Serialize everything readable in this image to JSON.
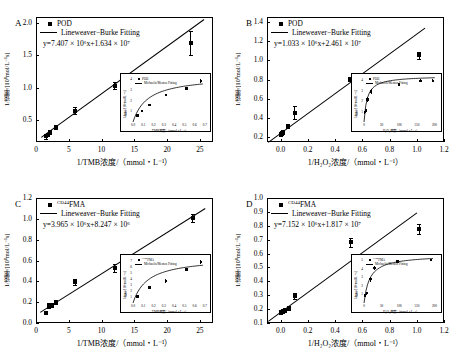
{
  "figure": {
    "panels": [
      {
        "letter": "A",
        "legend_marker_label": "POD",
        "legend_line_label": "Lineweaver−Burke Fitting",
        "equation": "y=7.407 × 10⁶x+1.634 × 10⁷",
        "equation_slope": 7407000.0,
        "equation_intercept": 16340000.0,
        "xlabel": "1/TMB浓度/（mmol・L⁻¹）",
        "ylabel": "1/速率/[10⁸mol/L⁻¹s]",
        "xticks": [
          "0",
          "5",
          "10",
          "15",
          "20",
          "25"
        ],
        "yticks": [
          "0.5",
          "1.0",
          "1.5",
          "2.0"
        ],
        "inset": {
          "legend_marker_label": "POD",
          "legend_line_label": "Michaelis/Menten Fitting",
          "xlabel": "TMB浓度/（mmol・L⁻¹）",
          "ylabel": "1/速率/[10⁸mol/L⁻¹s]",
          "xticks": [
            "0.0",
            "0.1",
            "0.2",
            "0.3",
            "0.4",
            "0.5",
            "0.6",
            "0.7"
          ],
          "yticks": [
            "1",
            "2",
            "3",
            "4"
          ]
        }
      },
      {
        "letter": "B",
        "legend_marker_label": "POD",
        "legend_line_label": "Lineweaver−Burke Fitting",
        "equation": "y=1.033 × 10⁶x+2.461 × 10⁷",
        "equation_slope": 1033000.0,
        "equation_intercept": 24610000.0,
        "xlabel": "1/H₂O₂浓度/（mmol・L⁻¹）",
        "ylabel": "1/速率/[10⁸mol/L⁻¹s]",
        "xticks": [
          "0.0",
          "0.2",
          "0.4",
          "0.6",
          "0.8",
          "1.0",
          "1.2"
        ],
        "yticks": [
          "0.2",
          "0.4",
          "0.6",
          "0.8",
          "1.0",
          "1.2",
          "1.4"
        ],
        "inset": {
          "legend_marker_label": "POD",
          "legend_line_label": "Michaelis/Menten Fitting",
          "xlabel": "H₂O₂浓度/（mmol・L⁻¹）",
          "ylabel": "1/速率/[10⁸mol/L⁻¹s]",
          "xticks": [
            "0",
            "50",
            "100",
            "150",
            "200"
          ],
          "yticks": [
            "1",
            "2",
            "3",
            "4"
          ]
        }
      },
      {
        "letter": "C",
        "legend_marker_label": "CD44FMA",
        "legend_marker_sup": "CD44",
        "legend_marker_base": "FMA",
        "legend_line_label": "Lineweaver−Burke Fitting",
        "equation": "y=3.965 × 10⁶x+8.247 × 10⁶",
        "equation_slope": 3965000.0,
        "equation_intercept": 8247000.0,
        "xlabel": "1/TMB浓度/（mmol・L⁻¹）",
        "ylabel": "1/速率/[10⁸mol/L⁻¹s]",
        "xticks": [
          "0",
          "5",
          "10",
          "15",
          "20",
          "25"
        ],
        "yticks": [
          "0.0",
          "0.2",
          "0.4",
          "0.6",
          "0.8",
          "1.0",
          "1.2"
        ],
        "inset": {
          "legend_marker_label": "CD44FMA",
          "legend_marker_sup": "CD44",
          "legend_marker_base": "FMA",
          "legend_line_label": "Michaelis/Menten Fitting",
          "xlabel": "TMB浓度/（mmol・L⁻¹）",
          "ylabel": "1/速率/[10⁸mol/L⁻¹s]",
          "xticks": [
            "0.0",
            "0.1",
            "0.2",
            "0.3",
            "0.4",
            "0.5",
            "0.6",
            "0.7"
          ],
          "yticks": [
            "1",
            "2",
            "3",
            "4",
            "5",
            "6",
            "7"
          ]
        }
      },
      {
        "letter": "D",
        "legend_marker_label": "CD44FMA",
        "legend_marker_sup": "CD44",
        "legend_marker_base": "FMA",
        "legend_line_label": "Lineweaver−Burke Fitting",
        "equation": "y=7.152 × 10⁶x+1.817 × 10⁷",
        "equation_slope": 7152000.0,
        "equation_intercept": 18170000.0,
        "xlabel": "1/H₂O₂浓度/（mmol・L⁻¹）",
        "ylabel": "1/速率/[10⁸mol/L⁻¹s]",
        "xticks": [
          "0.0",
          "0.2",
          "0.4",
          "0.6",
          "0.8",
          "1.0",
          "1.2"
        ],
        "yticks": [
          "0.1",
          "0.2",
          "0.3",
          "0.4",
          "0.5",
          "0.6",
          "0.7",
          "0.8",
          "0.9",
          "1.0"
        ],
        "inset": {
          "legend_marker_label": "CD44FMA",
          "legend_marker_sup": "CD44",
          "legend_marker_base": "FMA",
          "legend_line_label": "Michaelis/Menten Fitting",
          "xlabel": "H₂O₂浓度/（mmol・L⁻¹）",
          "ylabel": "1/速率/[10⁸mol/L⁻¹s]",
          "xticks": [
            "0",
            "50",
            "100",
            "150",
            "200"
          ],
          "yticks": [
            "1",
            "2",
            "3",
            "4",
            "5"
          ]
        }
      }
    ]
  },
  "chart_data": [
    {
      "id": "A",
      "type": "scatter",
      "title": "A",
      "xlabel": "1/TMB浓度/（mmol・L⁻¹）",
      "ylabel": "1/速率/[10⁸mol/L⁻¹s]",
      "xlim": [
        0,
        27
      ],
      "ylim": [
        0.15,
        2.1
      ],
      "grid": false,
      "legend_position": "top-left",
      "annotations": [
        "y=7.407 × 10⁶x+1.634 × 10⁷"
      ],
      "series": [
        {
          "name": "POD",
          "marker": "filled-square",
          "x": [
            1.6,
            1.9,
            2.2,
            3.1,
            6.0,
            12.0,
            23.6
          ],
          "y": [
            0.24,
            0.26,
            0.3,
            0.38,
            0.64,
            1.03,
            1.69
          ],
          "yerr": [
            0.04,
            0.02,
            0.02,
            0.02,
            0.06,
            0.05,
            0.19
          ]
        },
        {
          "name": "Lineweaver−Burke Fitting",
          "type": "line",
          "slope": 0.07407,
          "intercept": 0.1634,
          "x_range": [
            0.8,
            25.6
          ]
        }
      ],
      "inset": {
        "type": "scatter",
        "xlabel": "TMB浓度/（mmol・L⁻¹）",
        "ylabel": "1/速率/[10⁸mol/L⁻¹s]",
        "xlim": [
          0.0,
          0.72
        ],
        "ylim": [
          0,
          4.3
        ],
        "series": [
          {
            "name": "POD",
            "marker": "filled-square",
            "x": [
              0.045,
              0.085,
              0.16,
              0.32,
              0.52,
              0.66
            ],
            "y": [
              0.62,
              1.05,
              1.6,
              2.52,
              3.15,
              3.85
            ],
            "yerr": [
              0.08,
              0.08,
              0.1,
              0.12,
              0.15,
              0.2
            ]
          },
          {
            "name": "Michaelis/Menten Fitting",
            "type": "curve"
          }
        ]
      }
    },
    {
      "id": "B",
      "type": "scatter",
      "title": "B",
      "xlabel": "1/H₂O₂浓度/（mmol・L⁻¹）",
      "ylabel": "1/速率/[10⁸mol/L⁻¹s]",
      "xlim": [
        -0.1,
        1.2
      ],
      "ylim": [
        0.15,
        1.45
      ],
      "grid": false,
      "legend_position": "top-left",
      "annotations": [
        "y=1.033 × 10⁶x+2.461 × 10⁷"
      ],
      "series": [
        {
          "name": "POD",
          "marker": "filled-square",
          "x": [
            0.005,
            0.012,
            0.02,
            0.055,
            0.105,
            0.51,
            1.02
          ],
          "y": [
            0.235,
            0.245,
            0.25,
            0.32,
            0.455,
            0.805,
            1.05
          ],
          "yerr": [
            0.02,
            0.02,
            0.02,
            0.02,
            0.065,
            0.02,
            0.035
          ]
        },
        {
          "name": "Lineweaver−Burke Fitting",
          "type": "line",
          "slope": 1.033,
          "intercept": 0.2461,
          "x_range": [
            -0.09,
            1.06
          ]
        }
      ],
      "inset": {
        "type": "scatter",
        "xlabel": "H₂O₂浓度/（mmol・L⁻¹）",
        "ylabel": "1/速率/[10⁸mol/L⁻¹s]",
        "xlim": [
          0,
          210
        ],
        "ylim": [
          0,
          4.4
        ],
        "series": [
          {
            "name": "POD",
            "marker": "filled-square",
            "x": [
              2,
              5,
              10,
              20,
              100,
              160,
              195
            ],
            "y": [
              0.95,
              1.1,
              2.15,
              2.9,
              3.6,
              3.95,
              3.95
            ],
            "yerr": [
              0.15,
              0.15,
              0.25,
              0.25,
              0.12,
              0.15,
              0.12
            ]
          },
          {
            "name": "Michaelis/Menten Fitting",
            "type": "curve"
          }
        ]
      }
    },
    {
      "id": "C",
      "type": "scatter",
      "title": "C",
      "xlabel": "1/TMB浓度/（mmol・L⁻¹）",
      "ylabel": "1/速率/[10⁸mol/L⁻¹s]",
      "xlim": [
        0,
        27
      ],
      "ylim": [
        0.0,
        1.2
      ],
      "grid": false,
      "legend_position": "top-left",
      "annotations": [
        "y=3.965 × 10⁶x+8.247 × 10⁶"
      ],
      "series": [
        {
          "name": "CD44FMA",
          "marker": "filled-square",
          "x": [
            1.6,
            2.0,
            2.4,
            3.1,
            6.0,
            12.0,
            23.9
          ],
          "y": [
            0.1,
            0.165,
            0.175,
            0.2,
            0.395,
            0.525,
            1.01
          ],
          "yerr": [
            0.015,
            0.025,
            0.02,
            0.02,
            0.03,
            0.04,
            0.04
          ]
        },
        {
          "name": "Lineweaver−Burke Fitting",
          "type": "line",
          "slope": 0.03965,
          "intercept": 0.08247,
          "x_range": [
            0.6,
            25.8
          ]
        }
      ],
      "inset": {
        "type": "scatter",
        "xlabel": "TMB浓度/（mmol・L⁻¹）",
        "ylabel": "1/速率/[10⁸mol/L⁻¹s]",
        "xlim": [
          0.0,
          0.72
        ],
        "ylim": [
          0,
          7.6
        ],
        "series": [
          {
            "name": "CD44FMA",
            "marker": "filled-square",
            "x": [
              0.045,
              0.16,
              0.32,
              0.52,
              0.66
            ],
            "y": [
              1.05,
              2.55,
              3.65,
              5.55,
              6.75
            ],
            "yerr": [
              0.15,
              0.3,
              0.35,
              0.3,
              0.3
            ]
          },
          {
            "name": "Michaelis/Menten Fitting",
            "type": "curve"
          }
        ]
      }
    },
    {
      "id": "D",
      "type": "scatter",
      "title": "D",
      "xlabel": "1/H₂O₂浓度/（mmol・L⁻¹）",
      "ylabel": "1/速率/[10⁸mol/L⁻¹s]",
      "xlim": [
        -0.1,
        1.2
      ],
      "ylim": [
        0.1,
        1.0
      ],
      "grid": false,
      "legend_position": "top-left",
      "annotations": [
        "y=7.152 × 10⁶x+1.817 × 10⁷"
      ],
      "series": [
        {
          "name": "CD44FMA",
          "marker": "filled-square",
          "x": [
            0.005,
            0.015,
            0.03,
            0.06,
            0.105,
            0.515,
            1.02
          ],
          "y": [
            0.18,
            0.185,
            0.195,
            0.21,
            0.295,
            0.68,
            0.775
          ],
          "yerr": [
            0.012,
            0.012,
            0.015,
            0.015,
            0.02,
            0.035,
            0.035
          ]
        },
        {
          "name": "Lineweaver−Burke Fitting",
          "type": "line",
          "slope": 0.7152,
          "intercept": 0.1817,
          "x_range": [
            -0.09,
            1.0
          ]
        }
      ],
      "inset": {
        "type": "scatter",
        "xlabel": "H₂O₂浓度/（mmol・L⁻¹）",
        "ylabel": "1/速率/[10⁸mol/L⁻¹s]",
        "xlim": [
          0,
          210
        ],
        "ylim": [
          0,
          5.4
        ],
        "series": [
          {
            "name": "CD44FMA",
            "marker": "filled-square",
            "x": [
              3,
              8,
              18,
              30,
              95,
              190
            ],
            "y": [
              0.9,
              1.15,
              2.8,
              4.1,
              4.85,
              5.05
            ],
            "yerr": [
              0.2,
              0.2,
              0.3,
              0.25,
              0.15,
              0.12
            ]
          },
          {
            "name": "Michaelis/Menten Fitting",
            "type": "curve"
          }
        ]
      }
    }
  ]
}
